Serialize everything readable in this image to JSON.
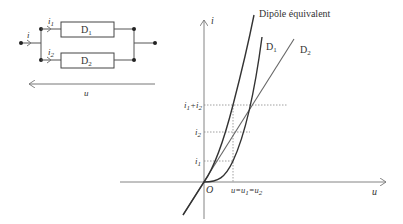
{
  "circuit": {
    "input_current": "i",
    "branch_currents": [
      {
        "symbol": "i",
        "sub": "1"
      },
      {
        "symbol": "i",
        "sub": "2"
      }
    ],
    "components": [
      {
        "label": "D",
        "sub": "1"
      },
      {
        "label": "D",
        "sub": "2"
      }
    ],
    "voltage_label": "u"
  },
  "graph": {
    "y_axis_label": "i",
    "x_axis_label": "u",
    "origin_label": "O",
    "curves": [
      {
        "name": "Dipôle équivalent",
        "label": "Dipôle équivalent"
      },
      {
        "name": "D1",
        "label": "D",
        "sub": "1"
      },
      {
        "name": "D2",
        "label": "D",
        "sub": "2"
      }
    ],
    "y_ticks": [
      {
        "label": "i₁+i₂",
        "parts": [
          "i",
          "1",
          "+i",
          "2"
        ]
      },
      {
        "label": "i₂",
        "parts": [
          "i",
          "2"
        ]
      },
      {
        "label": "i₁",
        "parts": [
          "i",
          "1"
        ]
      }
    ],
    "x_tick": {
      "label": "u=u₁=u₂",
      "parts": [
        "u=u",
        "1",
        "=u",
        "2"
      ]
    }
  },
  "colors": {
    "line": "#444444",
    "curve": "#333333",
    "dotted": "#888888"
  }
}
